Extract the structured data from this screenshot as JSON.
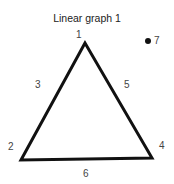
{
  "title": "Linear graph 1",
  "vertices": {
    "v1": "1",
    "v2": "2",
    "v4": "4",
    "v7": "7"
  },
  "edges": {
    "e3": "3",
    "e5": "5",
    "e6": "6"
  },
  "colors": {
    "line": "#111111",
    "text": "#444444"
  }
}
